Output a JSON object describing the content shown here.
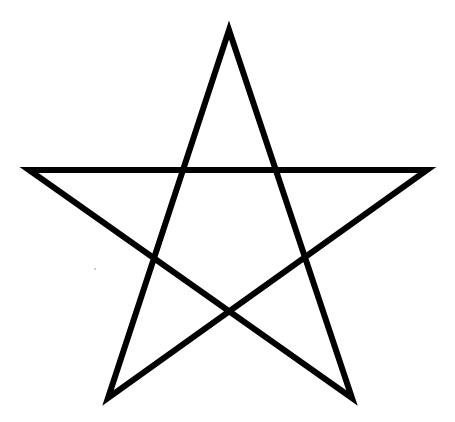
{
  "figure": {
    "stroke_color": "#000000",
    "background_color": "#ffffff",
    "stroke_width": 6,
    "points": [
      [
        229,
        30
      ],
      [
        352,
        398
      ],
      [
        29,
        170
      ],
      [
        427,
        170
      ],
      [
        108,
        398
      ]
    ]
  },
  "speck": {
    "x": 94,
    "y": 268,
    "color": "#bdbdbd"
  }
}
